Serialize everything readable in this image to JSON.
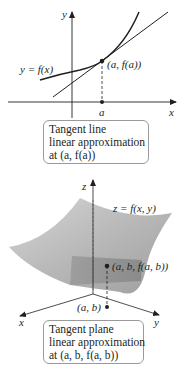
{
  "top_diagram": {
    "axis_x_label": "x",
    "axis_y_label": "y",
    "curve_label": "y = f(x)",
    "point_label": "(a, f(a))",
    "tick_label": "a",
    "caption": {
      "line1": "Tangent line",
      "line2": "linear approximation",
      "line3": "at (a, f(a))"
    }
  },
  "bottom_diagram": {
    "axis_x_label": "x",
    "axis_y_label": "y",
    "axis_z_label": "z",
    "surface_label": "z = f(x, y)",
    "point_label": "(a, b, f(a, b))",
    "base_point_label": "(a, b)",
    "caption": {
      "line1": "Tangent plane",
      "line2": "linear approximation",
      "line3": "at (a, b, f(a, b))"
    }
  },
  "colors": {
    "ink": "#231f20",
    "surface": "#bdbdbd",
    "plane": "#8f8f8f",
    "box_border": "#9a9a9a"
  }
}
